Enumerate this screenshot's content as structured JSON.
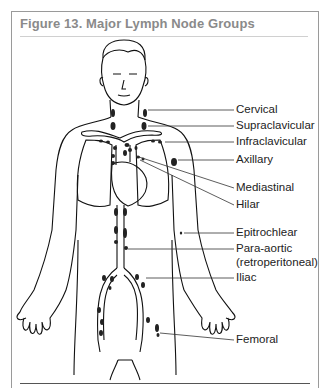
{
  "figure": {
    "title": "Figure 13. Major Lymph Node Groups"
  },
  "labels": [
    {
      "name": "cervical",
      "text": "Cervical",
      "y": 152
    },
    {
      "name": "supraclavicular",
      "text": "Supraclavicular",
      "y": 168
    },
    {
      "name": "infraclavicular",
      "text": "Infraclavicular",
      "y": 184
    },
    {
      "name": "axillary",
      "text": "Axillary",
      "y": 200
    },
    {
      "name": "mediastinal",
      "text": "Mediastinal",
      "y": 230
    },
    {
      "name": "hilar",
      "text": "Hilar",
      "y": 247
    },
    {
      "name": "epitrochlear",
      "text": "Epitrochlear",
      "y": 265
    },
    {
      "name": "para-aortic",
      "text": "Para-aortic",
      "y": 281
    },
    {
      "name": "para-aortic-sub",
      "text": "(retroperitoneal)",
      "y": 294
    },
    {
      "name": "iliac",
      "text": "Iliac",
      "y": 309
    },
    {
      "name": "femoral",
      "text": "Femoral",
      "y": 340
    }
  ]
}
